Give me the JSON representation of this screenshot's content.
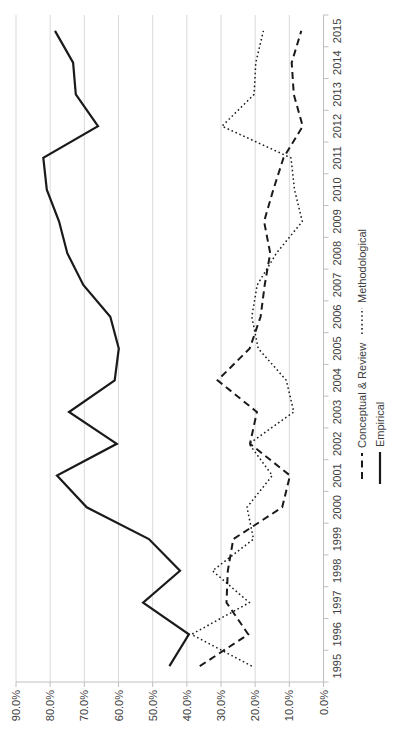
{
  "chart_data": {
    "type": "line",
    "orientation": "landscape chart rotated 90deg counter-clockwise",
    "categories": [
      "1995",
      "1996",
      "1997",
      "1998",
      "1999",
      "2000",
      "2001",
      "2002",
      "2003",
      "2004",
      "2005",
      "2006",
      "2007",
      "2008",
      "2009",
      "2010",
      "2011",
      "2012",
      "2013",
      "2014",
      "2015"
    ],
    "series": [
      {
        "name": "Conceptual & Review",
        "style": "dashed",
        "values": [
          36.2,
          22.0,
          28.4,
          28.0,
          26.4,
          12.1,
          9.8,
          21.5,
          19.5,
          31.0,
          21.6,
          18.4,
          17.2,
          15.6,
          17.4,
          14.7,
          11.7,
          6.1,
          8.7,
          9.3,
          6.5
        ]
      },
      {
        "name": "Methodological",
        "style": "dotted",
        "values": [
          21.0,
          38.6,
          21.7,
          32.5,
          20.5,
          22.4,
          15.0,
          21.8,
          8.7,
          10.9,
          19.1,
          21.0,
          19.4,
          13.8,
          6.2,
          8.5,
          9.5,
          29.7,
          20.3,
          19.8,
          17.6
        ]
      },
      {
        "name": "Empirical",
        "style": "solid",
        "values": [
          45.1,
          39.4,
          52.8,
          42.0,
          51.1,
          69.3,
          78.0,
          60.5,
          74.5,
          61.1,
          59.9,
          62.4,
          70.3,
          75.0,
          77.4,
          81.0,
          82.0,
          66.0,
          72.5,
          73.3,
          78.6
        ]
      }
    ],
    "xlabel": "",
    "ylabel": "",
    "title": "",
    "ylim": [
      0,
      90
    ],
    "ytick_step": 10,
    "ytick_labels": [
      "0.0%",
      "10.0%",
      "20.0%",
      "30.0%",
      "40.0%",
      "50.0%",
      "60.0%",
      "70.0%",
      "80.0%",
      "90.0%"
    ],
    "grid": true,
    "legend_position": "bottom",
    "legend_entries": [
      "Conceptual & Review",
      "Methodological",
      "Empirical"
    ]
  },
  "colors": {
    "series_stroke": "#1a1a1a",
    "gridline": "#d9d9d9",
    "axis_line": "#bfbfbf",
    "tick_mark": "#bfbfbf",
    "label_text": "#404040",
    "background": "#ffffff"
  }
}
